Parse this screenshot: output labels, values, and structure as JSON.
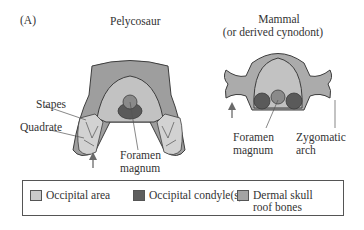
{
  "panel_label": "(A)",
  "titles": {
    "pelycosaur": "Pelycosaur",
    "mammal_line1": "Mammal",
    "mammal_line2": "(or derived cynodont)"
  },
  "annotations": {
    "stapes": "Stapes",
    "quadrate": "Quadrate",
    "foramen_left_1": "Foramen",
    "foramen_left_2": "magnum",
    "foramen_right_1": "Foramen",
    "foramen_right_2": "magnum",
    "zygomatic_1": "Zygomatic",
    "zygomatic_2": "arch"
  },
  "legend": {
    "items": [
      {
        "label": "Occipital area",
        "color": "#c9c9c9"
      },
      {
        "label": "Occipital condyle(s)",
        "color": "#5e5e5e"
      },
      {
        "label_line1": "Dermal skull",
        "label_line2": "roof bones",
        "color": "#a3a3a3"
      }
    ]
  },
  "colors": {
    "dermal": "#9e9e9e",
    "occipital": "#c2c2c2",
    "occipital_light": "#d2d2d2",
    "condyle": "#5a5a5a",
    "foramen": "#8a8a8a",
    "outline": "#3d3d3d"
  }
}
